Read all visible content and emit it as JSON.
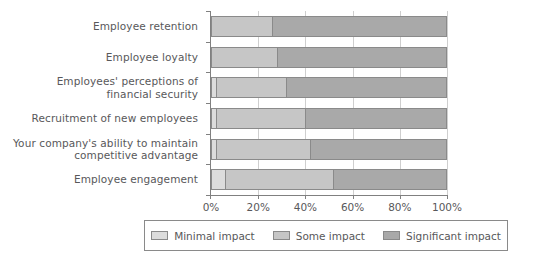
{
  "chart_data": {
    "type": "bar",
    "subtype": "stacked-horizontal-100pct",
    "title": "",
    "xlabel": "",
    "ylabel": "",
    "xlim": [
      0,
      100
    ],
    "xticks": [
      "0%",
      "20%",
      "40%",
      "60%",
      "80%",
      "100%"
    ],
    "xtick_values": [
      0,
      20,
      40,
      60,
      80,
      100
    ],
    "grid": true,
    "legend_position": "bottom",
    "categories": [
      "Employee retention",
      "Employee loyalty",
      "Employees' perceptions of\nfinancial security",
      "Recruitment of new employees",
      "Your company's ability to maintain\ncompetitive advantage",
      "Employee engagement"
    ],
    "series": [
      {
        "name": "Minimal impact",
        "color": "#dcdcdc",
        "values": [
          0,
          0,
          2,
          2,
          2,
          6
        ]
      },
      {
        "name": "Some impact",
        "color": "#c6c6c6",
        "values": [
          26,
          28,
          30,
          38,
          40,
          46
        ]
      },
      {
        "name": "Significant impact",
        "color": "#a9a9a9",
        "values": [
          74,
          72,
          68,
          60,
          58,
          48
        ]
      }
    ]
  },
  "legend": {
    "items": [
      {
        "label": "Minimal impact",
        "color": "#dcdcdc"
      },
      {
        "label": "Some impact",
        "color": "#c6c6c6"
      },
      {
        "label": "Significant impact",
        "color": "#a9a9a9"
      }
    ]
  },
  "colors": {
    "axis": "#808080",
    "grid": "#cfcfcf",
    "text": "#58585a",
    "bar_border": "#8a8a8a",
    "background": "#ffffff"
  }
}
